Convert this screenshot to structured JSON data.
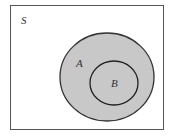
{
  "diagram": {
    "type": "venn",
    "universe_label": "S",
    "sets": [
      {
        "label": "A",
        "fill": "#c8c8c8",
        "stroke": "#333333"
      },
      {
        "label": "B",
        "fill": "#c8c8c8",
        "stroke": "#222222",
        "subset_of": "A"
      }
    ],
    "colors": {
      "background": "#ffffff",
      "frame": "#555555",
      "shading": "#c8c8c8"
    }
  }
}
